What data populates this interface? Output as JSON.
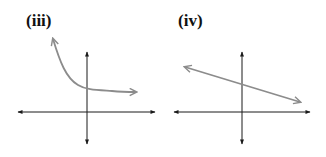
{
  "panels": [
    {
      "label": "(iii)",
      "description": "Decreasing curve approaching a horizontal asymptote above the x-axis, crossing the positive y-axis",
      "curve_type": "exponential-decay"
    },
    {
      "label": "(iv)",
      "description": "Straight line with negative slope and positive y-intercept",
      "curve_type": "linear-decreasing"
    }
  ],
  "colors": {
    "axes": "#1a1a1a",
    "curve": "#8c8c8c",
    "label": "#111111"
  }
}
